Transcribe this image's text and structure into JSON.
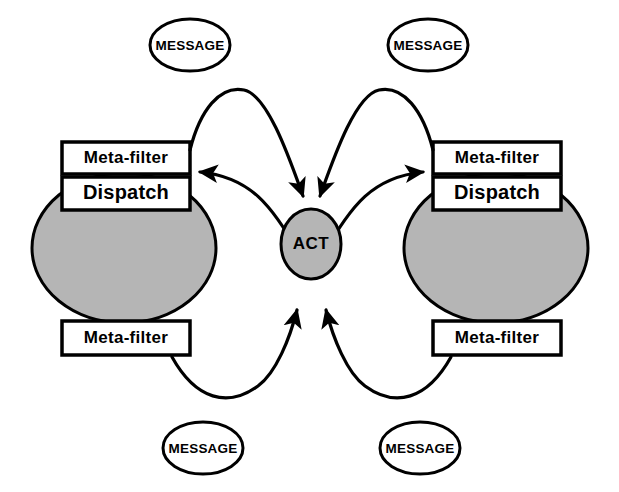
{
  "diagram": {
    "colors": {
      "agent_body_fill": "#b5b5b5",
      "act_fill": "#b5b5b5",
      "box_fill": "#ffffff",
      "message_fill": "#ffffff",
      "stroke": "#000000",
      "background": "#ffffff"
    },
    "nodes": {
      "left_agent": {
        "top_filter_label": "Meta-filter",
        "dispatch_label": "Dispatch",
        "bottom_filter_label": "Meta-filter"
      },
      "right_agent": {
        "top_filter_label": "Meta-filter",
        "dispatch_label": "Dispatch",
        "bottom_filter_label": "Meta-filter"
      },
      "center": {
        "label": "ACT"
      },
      "messages": [
        {
          "id": "message-top-left",
          "label": "MESSAGE"
        },
        {
          "id": "message-top-right",
          "label": "MESSAGE"
        },
        {
          "id": "message-bottom-left",
          "label": "MESSAGE"
        },
        {
          "id": "message-bottom-right",
          "label": "MESSAGE"
        }
      ]
    },
    "edges": [
      {
        "id": "edge-left-top-out",
        "from": "left_agent.top_filter",
        "to": "center",
        "direction": "to-center"
      },
      {
        "id": "edge-center-to-left-top",
        "from": "center",
        "to": "left_agent.top_filter",
        "direction": "to-agent"
      },
      {
        "id": "edge-right-top-out",
        "from": "right_agent.top_filter",
        "to": "center",
        "direction": "to-center"
      },
      {
        "id": "edge-center-to-right-top",
        "from": "center",
        "to": "right_agent.top_filter",
        "direction": "to-agent"
      },
      {
        "id": "edge-left-bottom-in",
        "from": "left_agent.bottom_filter",
        "to": "center",
        "direction": "to-center"
      },
      {
        "id": "edge-right-bottom-in",
        "from": "right_agent.bottom_filter",
        "to": "center",
        "direction": "to-center"
      }
    ]
  }
}
